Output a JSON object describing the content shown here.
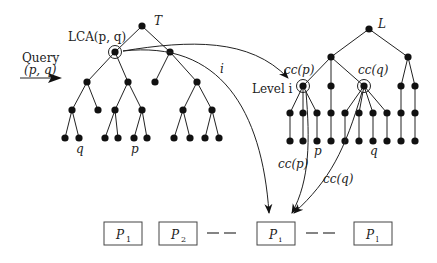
{
  "query": {
    "label_line1": "Query",
    "label_line2": "(p, q)"
  },
  "left_tree": {
    "name": "T",
    "lca_label": "LCA(p, q)",
    "leaf_labels": {
      "q": "q",
      "p": "p"
    }
  },
  "right_tree": {
    "name": "L",
    "level_label": "Level i",
    "cc_p": "cc(p)",
    "cc_q": "cc(q)",
    "leaf_labels": {
      "p": "p",
      "q": "q"
    }
  },
  "arrows": {
    "i_label": "i",
    "cc_p_label": "cc(p)",
    "cc_q_label": "cc(q)"
  },
  "partitions": [
    {
      "label": "P",
      "sub": "1"
    },
    {
      "label": "P",
      "sub": "2"
    },
    {
      "label": "P",
      "sub": "i"
    },
    {
      "label": "P",
      "sub": "l"
    }
  ],
  "dashes": "— —"
}
